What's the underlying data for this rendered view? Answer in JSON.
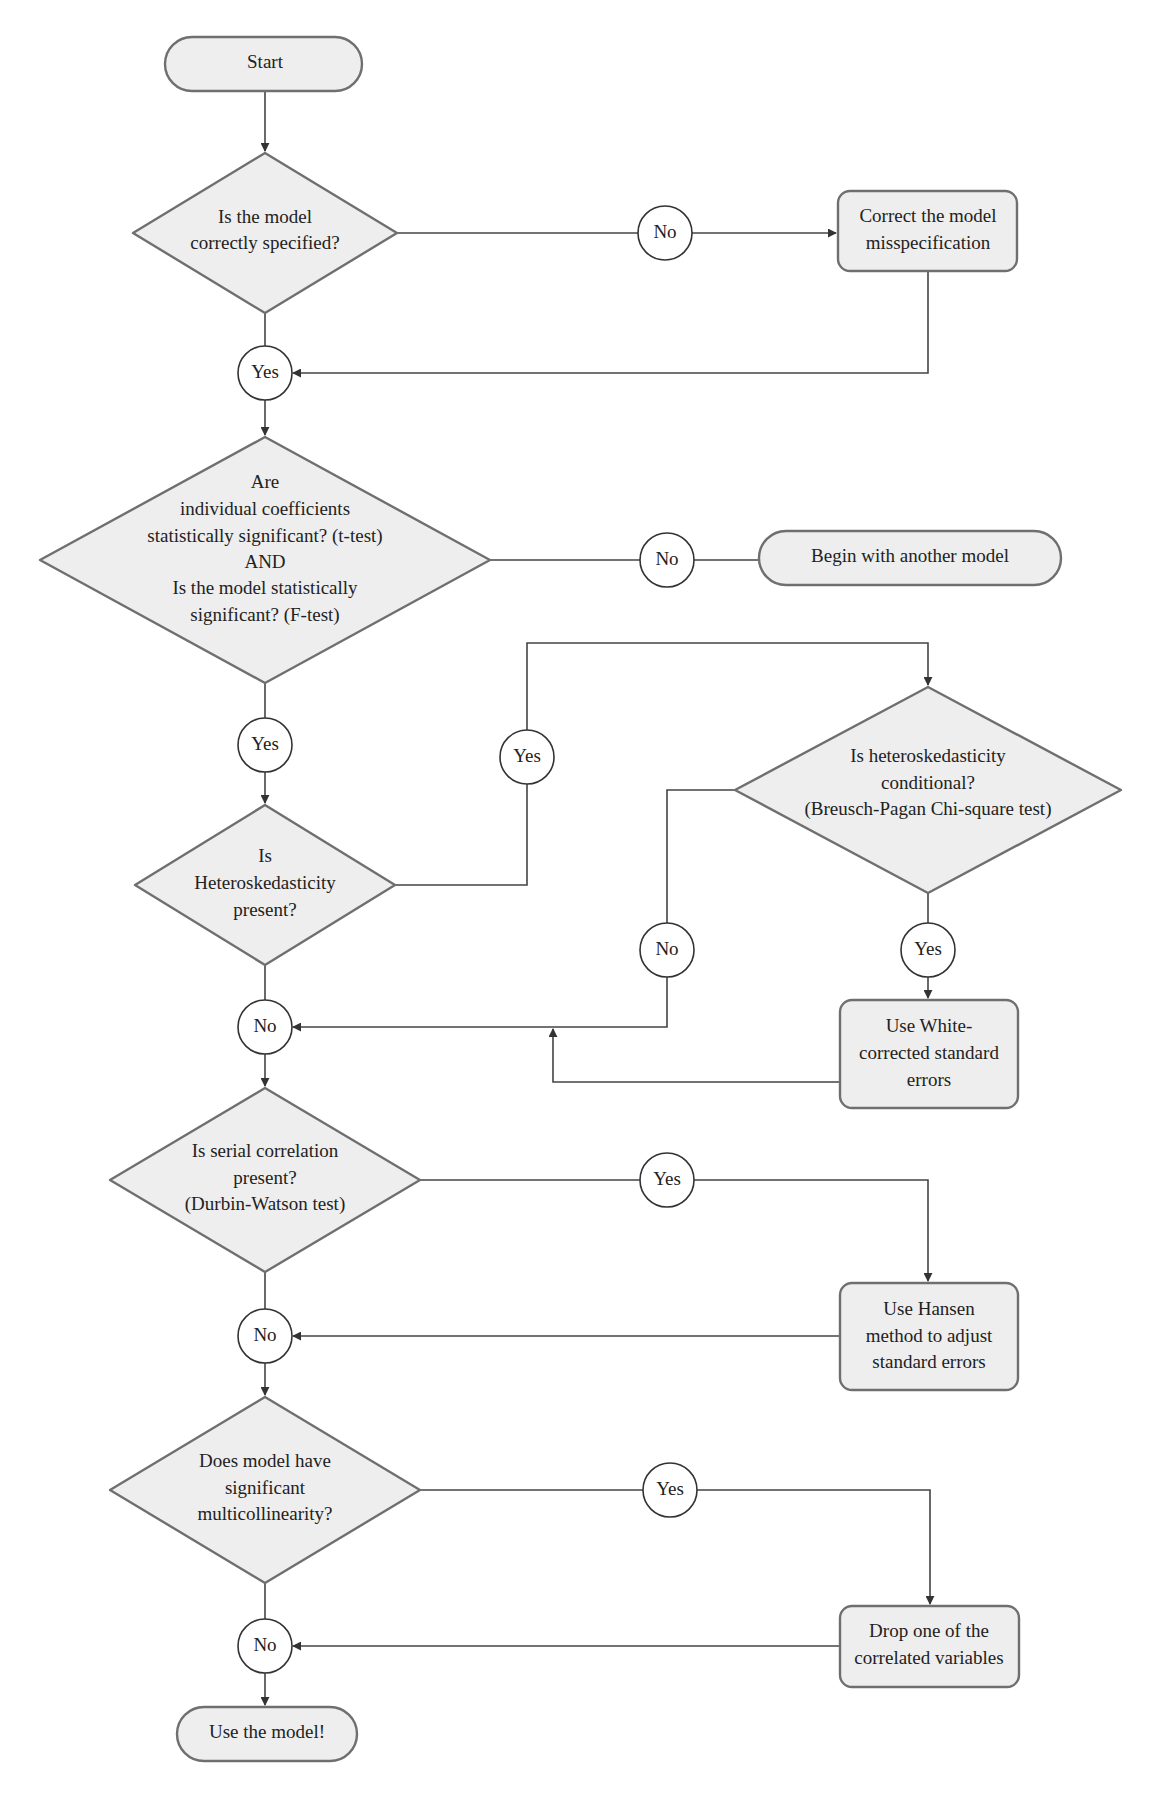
{
  "diagram": {
    "type": "flowchart",
    "colors": {
      "node_fill": "#eeeeee",
      "node_stroke": "#6f6f6f",
      "edge": "#444444",
      "connector_fill": "#ffffff"
    },
    "nodes": {
      "start": {
        "label": "Start"
      },
      "q_spec": {
        "lines": [
          "Is the model",
          "correctly specified?"
        ]
      },
      "fix_spec": {
        "lines": [
          "Correct the model",
          "misspecification"
        ]
      },
      "q_signif": {
        "lines": [
          "Are",
          "individual coefficients",
          "statistically significant? (t-test)",
          "AND",
          "Is the model statistically",
          "significant? (F-test)"
        ]
      },
      "another_model": {
        "label": "Begin with another model"
      },
      "q_hetero": {
        "lines": [
          "Is",
          "Heteroskedasticity",
          "present?"
        ]
      },
      "q_conditional": {
        "lines": [
          "Is heteroskedasticity",
          "conditional?",
          "(Breusch-Pagan Chi-square test)"
        ]
      },
      "white_se": {
        "lines": [
          "Use White-",
          "corrected standard",
          "errors"
        ]
      },
      "q_serial": {
        "lines": [
          "Is serial correlation",
          "present?",
          "(Durbin-Watson test)"
        ]
      },
      "hansen": {
        "lines": [
          "Use Hansen",
          "method to adjust",
          "standard errors"
        ]
      },
      "q_multi": {
        "lines": [
          "Does model have",
          "significant",
          "multicollinearity?"
        ]
      },
      "drop_var": {
        "lines": [
          "Drop one of the",
          "correlated variables"
        ]
      },
      "use_model": {
        "label": "Use the model!"
      }
    },
    "connectors": {
      "spec_no": "No",
      "spec_yes": "Yes",
      "signif_no": "No",
      "signif_yes": "Yes",
      "hetero_yes": "Yes",
      "conditional_no": "No",
      "conditional_yes": "Yes",
      "hetero_no": "No",
      "serial_yes": "Yes",
      "serial_no": "No",
      "multi_yes": "Yes",
      "multi_no": "No"
    }
  }
}
